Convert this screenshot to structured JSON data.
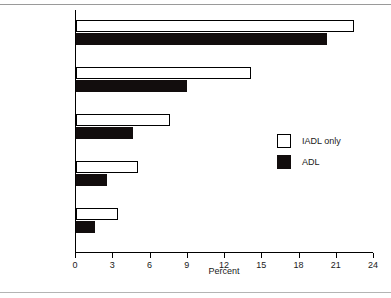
{
  "chart_data": {
    "type": "bar",
    "orientation": "horizontal",
    "title": "",
    "xlabel": "Percent",
    "ylabel": "Age Group",
    "categories": [
      "85+",
      "75–84",
      "70–74",
      "65–69",
      "45–64"
    ],
    "series": [
      {
        "name": "IADL only",
        "color": "#ffffff",
        "values": [
          22.4,
          14.1,
          7.6,
          5.0,
          3.4
        ]
      },
      {
        "name": "ADL",
        "color": "#120d0d",
        "values": [
          20.2,
          8.9,
          4.6,
          2.5,
          1.5
        ]
      }
    ],
    "xlim": [
      0,
      24
    ],
    "xticks": [
      0,
      3,
      6,
      9,
      12,
      15,
      18,
      21,
      24
    ],
    "xtick_labels": [
      "0",
      "3",
      "6",
      "9",
      "12",
      "15",
      "18",
      "21",
      "24"
    ],
    "grid": false,
    "legend_position": "center-right",
    "legend_entries": [
      "IADL only",
      "ADL"
    ]
  },
  "axes": {
    "x_title": "Percent",
    "y_title": "Age Group"
  },
  "colors": {
    "axis": "#000000",
    "bar_outline": "#000000",
    "adl_fill": "#120d0d",
    "iadl_fill": "#ffffff",
    "page_rule": "#9a9a9a"
  }
}
